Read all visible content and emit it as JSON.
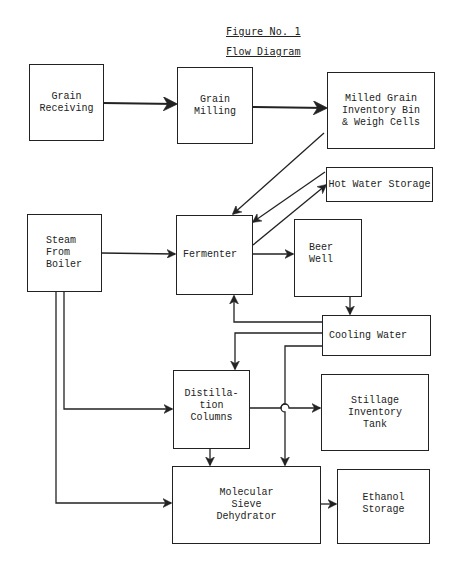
{
  "figure": {
    "number_label": "Figure No. 1",
    "title": "Flow Diagram"
  },
  "nodes": {
    "grain_receiving": {
      "label": "Grain\nReceiving"
    },
    "grain_milling": {
      "label": "Grain\nMilling"
    },
    "milled_grain_bin": {
      "label": "Milled Grain\nInventory Bin\n& Weigh Cells"
    },
    "hot_water_storage": {
      "label": "Hot Water Storage"
    },
    "steam_from_boiler": {
      "label": "Steam\nFrom\nBoiler"
    },
    "fermenter": {
      "label": "Fermenter"
    },
    "beer_well": {
      "label": "Beer\nWell"
    },
    "cooling_water": {
      "label": "Cooling Water"
    },
    "distillation_columns": {
      "label": "Distilla-\ntion\nColumns"
    },
    "stillage_inventory_tank": {
      "label": "Stillage\nInventory\nTank"
    },
    "molecular_sieve_dehydrator": {
      "label": "Molecular\nSieve\nDehydrator"
    },
    "ethanol_storage": {
      "label": "Ethanol\nStorage"
    }
  },
  "edges": [
    {
      "from": "Grain Receiving",
      "to": "Grain Milling"
    },
    {
      "from": "Grain Milling",
      "to": "Milled Grain Inventory Bin & Weigh Cells"
    },
    {
      "from": "Milled Grain Inventory Bin & Weigh Cells",
      "to": "Fermenter"
    },
    {
      "from": "Hot Water Storage",
      "to": "Fermenter"
    },
    {
      "from": "Fermenter",
      "to": "Hot Water Storage"
    },
    {
      "from": "Steam From Boiler",
      "to": "Fermenter"
    },
    {
      "from": "Fermenter",
      "to": "Beer Well"
    },
    {
      "from": "Beer Well",
      "to": "Cooling Water"
    },
    {
      "from": "Cooling Water",
      "to": "Fermenter"
    },
    {
      "from": "Cooling Water",
      "to": "Distillation Columns"
    },
    {
      "from": "Cooling Water",
      "to": "Molecular Sieve Dehydrator"
    },
    {
      "from": "Steam From Boiler",
      "to": "Distillation Columns"
    },
    {
      "from": "Steam From Boiler",
      "to": "Molecular Sieve Dehydrator"
    },
    {
      "from": "Distillation Columns",
      "to": "Stillage Inventory Tank"
    },
    {
      "from": "Distillation Columns",
      "to": "Molecular Sieve Dehydrator"
    },
    {
      "from": "Molecular Sieve Dehydrator",
      "to": "Ethanol Storage"
    }
  ]
}
